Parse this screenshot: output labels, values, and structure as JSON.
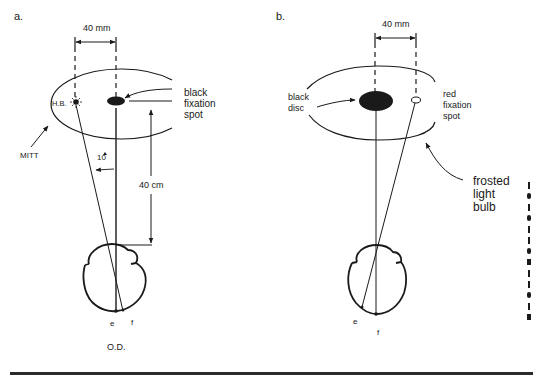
{
  "panel_a": {
    "label": "a.",
    "dimension_top": "40 mm",
    "hb_label": "H.B.",
    "fixation_label_1": "black",
    "fixation_label_2": "fixation",
    "fixation_label_3": "spot",
    "mitt_label": "MITT",
    "angle_label": "10",
    "distance_label": "40 cm",
    "point_e": "e",
    "point_f": "f",
    "eye_label": "O.D."
  },
  "panel_b": {
    "label": "b.",
    "dimension_top": "40 mm",
    "disc_label_1": "black",
    "disc_label_2": "disc",
    "fixation_label_1": "red",
    "fixation_label_2": "fixation",
    "fixation_label_3": "spot",
    "bulb_label_1": "frosted",
    "bulb_label_2": "light",
    "bulb_label_3": "bulb",
    "point_e": "e",
    "point_f": "f"
  },
  "colors": {
    "ink": "#1a1a1a",
    "background": "#ffffff"
  }
}
